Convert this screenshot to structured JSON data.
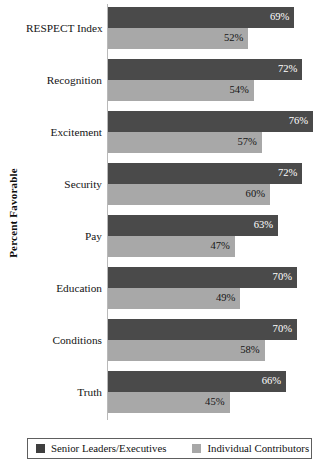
{
  "chart_data": {
    "type": "bar",
    "orientation": "horizontal",
    "title": "",
    "xlabel": "",
    "ylabel": "Percent Favorable",
    "xlim": [
      0,
      80
    ],
    "grid": false,
    "legend_position": "bottom",
    "value_suffix": "%",
    "categories": [
      "RESPECT Index",
      "Recognition",
      "Excitement",
      "Security",
      "Pay",
      "Education",
      "Conditions",
      "Truth"
    ],
    "series": [
      {
        "name": "Senior Leaders/Executives",
        "color": "#4a4a4a",
        "values": [
          69,
          72,
          76,
          72,
          63,
          70,
          70,
          66
        ],
        "labels": [
          "69%",
          "72%",
          "76%",
          "72%",
          "63%",
          "70%",
          "70%",
          "66%"
        ]
      },
      {
        "name": "Individual Contributors",
        "color": "#a8a8a8",
        "values": [
          52,
          54,
          57,
          60,
          47,
          49,
          58,
          45
        ],
        "labels": [
          "52%",
          "54%",
          "57%",
          "60%",
          "47%",
          "49%",
          "58%",
          "45%"
        ]
      }
    ]
  },
  "axis": {
    "y_title": "Percent Favorable"
  },
  "legend": {
    "items": [
      {
        "label": "Senior Leaders/Executives",
        "color": "#4a4a4a"
      },
      {
        "label": "Individual Contributors",
        "color": "#a8a8a8"
      }
    ]
  }
}
